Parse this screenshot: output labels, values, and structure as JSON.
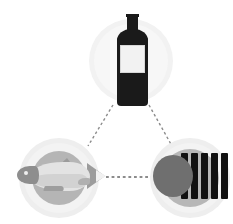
{
  "diagram": {
    "type": "triangular-pairing-diagram",
    "background_color": "#ffffff",
    "connector_color": "#8c8c8c",
    "connector_style": "dashed"
  },
  "nodes": [
    {
      "id": "wine",
      "label": "Wine bottle",
      "icon": "wine-bottle-icon",
      "position": "top",
      "center": {
        "x": 131,
        "y": 61
      },
      "colors": {
        "glass": "#1a1a1a",
        "label_paper": "#f2f2f2",
        "halo_outer": "#f2f2f2",
        "halo_inner": "#f7f7f7"
      },
      "parts": [
        "neck",
        "shoulder",
        "body",
        "label"
      ]
    },
    {
      "id": "fish",
      "label": "Fish",
      "icon": "fish-icon",
      "position": "bottom-left",
      "center": {
        "x": 59,
        "y": 178
      },
      "colors": {
        "body": "#e3e3e3",
        "body_shade": "#d2d2d2",
        "head": "#8e8e8e",
        "fins": "#9c9c9c",
        "disc": "#b5b5b5",
        "halo_outer": "#eeeeee",
        "halo_inner": "#f3f3f3"
      },
      "parts": [
        "head",
        "eye",
        "body",
        "dorsal-fin",
        "ventral-fin",
        "pectoral-fin",
        "tail"
      ]
    },
    {
      "id": "chocolate",
      "label": "Dark chocolate bar",
      "icon": "chocolate-bar-icon",
      "position": "bottom-right",
      "center": {
        "x": 190,
        "y": 178
      },
      "bar_count": 5,
      "colors": {
        "bars": "#111111",
        "round_piece": "#6f6f6f",
        "disc": "#b7b7b7",
        "halo_outer": "#eeeeee",
        "halo_inner": "#f3f3f3"
      },
      "parts": [
        "round-piece",
        "bar-1",
        "bar-2",
        "bar-3",
        "bar-4",
        "bar-5"
      ]
    }
  ],
  "connectors": [
    {
      "id": "wine-fish",
      "from": "wine",
      "to": "fish",
      "style": "dashed",
      "orientation": "diagonal-left"
    },
    {
      "id": "wine-chocolate",
      "from": "wine",
      "to": "chocolate",
      "style": "dashed",
      "orientation": "diagonal-right"
    },
    {
      "id": "fish-chocolate",
      "from": "fish",
      "to": "chocolate",
      "style": "dashed",
      "orientation": "horizontal"
    }
  ]
}
